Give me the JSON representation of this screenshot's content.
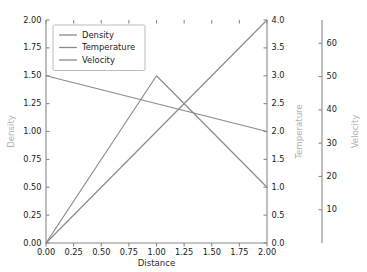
{
  "chart_data": {
    "type": "line",
    "title": "",
    "xlabel": "Distance",
    "ylabel": "Density",
    "xlim": [
      0.0,
      2.0
    ],
    "ylim": [
      0.0,
      2.0
    ],
    "grid": false,
    "legend_position": "upper left",
    "x_ticks": [
      "0.00",
      "0.25",
      "0.50",
      "0.75",
      "1.00",
      "1.25",
      "1.50",
      "1.75",
      "2.00"
    ],
    "x_tick_values": [
      0.0,
      0.25,
      0.5,
      0.75,
      1.0,
      1.25,
      1.5,
      1.75,
      2.0
    ],
    "y_ticks_left": [
      "0.00",
      "0.25",
      "0.50",
      "0.75",
      "1.00",
      "1.25",
      "1.50",
      "1.75",
      "2.00"
    ],
    "y_tick_values_left": [
      0.0,
      0.25,
      0.5,
      0.75,
      1.0,
      1.25,
      1.5,
      1.75,
      2.0
    ],
    "axes": [
      {
        "name": "left",
        "label": "Density",
        "lim": [
          0.0,
          2.0
        ],
        "ticks": [
          0.0,
          0.25,
          0.5,
          0.75,
          1.0,
          1.25,
          1.5,
          1.75,
          2.0
        ],
        "tick_labels": [
          "0.00",
          "0.25",
          "0.50",
          "0.75",
          "1.00",
          "1.25",
          "1.50",
          "1.75",
          "2.00"
        ]
      },
      {
        "name": "right-1",
        "label": "Temperature",
        "lim": [
          0.0,
          4.0
        ],
        "ticks": [
          0.0,
          0.5,
          1.0,
          1.5,
          2.0,
          2.5,
          3.0,
          3.5,
          4.0
        ],
        "tick_labels": [
          "0.0",
          "0.5",
          "1.0",
          "1.5",
          "2.0",
          "2.5",
          "3.0",
          "3.5",
          "4.0"
        ]
      },
      {
        "name": "right-2",
        "label": "Velocity",
        "lim": [
          0.0,
          67.0
        ],
        "ticks": [
          10,
          20,
          30,
          40,
          50,
          60
        ],
        "tick_labels": [
          "10",
          "20",
          "30",
          "40",
          "50",
          "60"
        ]
      }
    ],
    "series": [
      {
        "name": "Density",
        "axis": "left",
        "color": "#8a8a8a",
        "x": [
          0.0,
          2.0
        ],
        "values": [
          1.5,
          1.0
        ]
      },
      {
        "name": "Temperature",
        "axis": "right-1",
        "color": "#8a8a8a",
        "x": [
          0.0,
          1.0,
          2.0
        ],
        "values": [
          0.0,
          3.0,
          1.0
        ]
      },
      {
        "name": "Velocity",
        "axis": "right-2",
        "color": "#8a8a8a",
        "x": [
          0.0,
          2.0
        ],
        "values": [
          0.0,
          67.0
        ]
      }
    ],
    "legend": [
      {
        "label": "Density",
        "color": "#8a8a8a"
      },
      {
        "label": "Temperature",
        "color": "#8a8a8a"
      },
      {
        "label": "Velocity",
        "color": "#8a8a8a"
      }
    ]
  },
  "style": {
    "background": "#ffffff",
    "spine_color": "#8a8a8a",
    "tick_label_color": "#1a1a1a",
    "axis_label_color": "#b0b0b0",
    "line_color": "#8a8a8a"
  }
}
